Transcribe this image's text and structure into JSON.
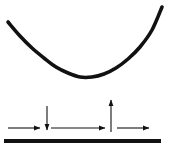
{
  "figure": {
    "width": 171,
    "height": 150,
    "background_color": "#ffffff",
    "stroke_color": "#111111",
    "title": "",
    "caption": ""
  },
  "chart_data": {
    "type": "line",
    "title": "",
    "subtitle": "",
    "xlabel": "",
    "ylabel": "",
    "xlim": [
      0,
      171
    ],
    "ylim": [
      0,
      150
    ],
    "grid": false,
    "legend_position": "none",
    "tick_labels_x": [],
    "tick_labels_y": [],
    "annotations": [],
    "series": [
      {
        "name": "u-shaped-curve",
        "type": "line",
        "stroke_color": "#111111",
        "stroke_width": 3.6,
        "x": [
          8,
          20,
          32,
          44,
          56,
          68,
          80,
          92,
          104,
          116,
          128,
          140,
          152,
          162
        ],
        "y": [
          22,
          36,
          48,
          58,
          67,
          73,
          77,
          77,
          74,
          68,
          59,
          47,
          30,
          7
        ]
      },
      {
        "name": "baseline",
        "type": "line",
        "stroke_color": "#111111",
        "stroke_width": 4.2,
        "x": [
          4,
          161
        ],
        "y": [
          141,
          141
        ]
      }
    ],
    "arrows": [
      {
        "name": "right-arrow-1",
        "direction": "right",
        "x_start": 8,
        "y_start": 128,
        "x_end": 40,
        "y_end": 128,
        "stroke_color": "#111111",
        "stroke_width": 1.1
      },
      {
        "name": "down-arrow",
        "direction": "down",
        "x_start": 47,
        "y_start": 106,
        "x_end": 47,
        "y_end": 130,
        "stroke_color": "#111111",
        "stroke_width": 1.1
      },
      {
        "name": "right-arrow-2",
        "direction": "right",
        "x_start": 51,
        "y_start": 128,
        "x_end": 105,
        "y_end": 128,
        "stroke_color": "#111111",
        "stroke_width": 1.1
      },
      {
        "name": "up-arrow",
        "direction": "up",
        "x_start": 111,
        "y_start": 132,
        "x_end": 111,
        "y_end": 100,
        "stroke_color": "#111111",
        "stroke_width": 1.1
      },
      {
        "name": "right-arrow-3",
        "direction": "right",
        "x_start": 117,
        "y_start": 128,
        "x_end": 149,
        "y_end": 128,
        "stroke_color": "#111111",
        "stroke_width": 1.1
      }
    ]
  }
}
